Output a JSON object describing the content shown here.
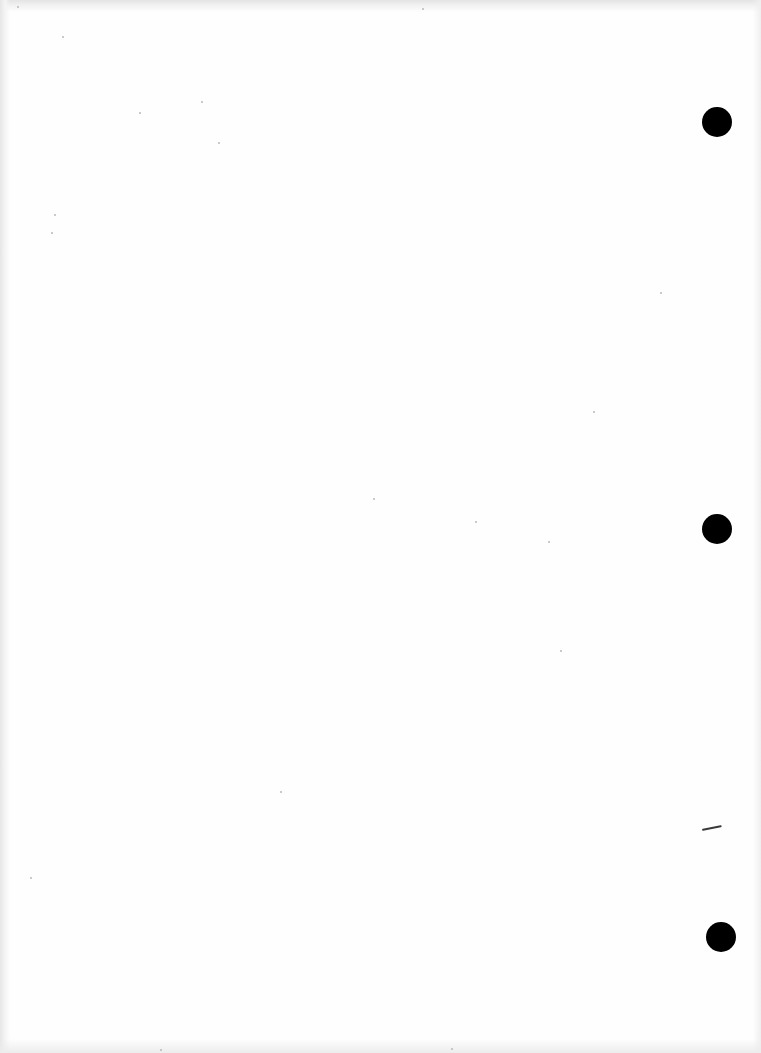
{
  "document": {
    "type": "scanned blank page",
    "text": "",
    "colors": {
      "paper": "#fefefe",
      "scan_edge": "#e4e4e4",
      "punch_hole": "#000000",
      "pen_mark": "#3a3a3a"
    },
    "punch_holes": [
      {
        "cx": 717,
        "cy": 122,
        "r": 15
      },
      {
        "cx": 717,
        "cy": 529,
        "r": 15
      },
      {
        "cx": 721,
        "cy": 937,
        "r": 15
      }
    ],
    "pen_mark": {
      "x1": 702,
      "y1": 829,
      "x2": 722,
      "y2": 825
    },
    "specks": [
      {
        "x": 17,
        "y": 6
      },
      {
        "x": 62,
        "y": 36
      },
      {
        "x": 139,
        "y": 112
      },
      {
        "x": 218,
        "y": 142
      },
      {
        "x": 201,
        "y": 101
      },
      {
        "x": 54,
        "y": 214
      },
      {
        "x": 51,
        "y": 232
      },
      {
        "x": 373,
        "y": 498
      },
      {
        "x": 475,
        "y": 521
      },
      {
        "x": 548,
        "y": 541
      },
      {
        "x": 593,
        "y": 411
      },
      {
        "x": 280,
        "y": 791
      },
      {
        "x": 30,
        "y": 877
      },
      {
        "x": 160,
        "y": 1049
      },
      {
        "x": 451,
        "y": 1048
      },
      {
        "x": 660,
        "y": 292
      },
      {
        "x": 560,
        "y": 650
      },
      {
        "x": 422,
        "y": 8
      }
    ]
  }
}
